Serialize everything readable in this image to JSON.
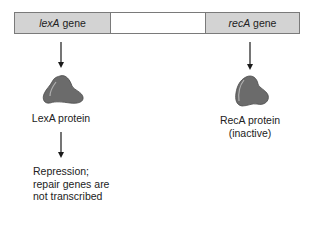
{
  "diagram": {
    "dna": {
      "genes": [
        {
          "name": "lexA",
          "suffix": " gene",
          "fill": "#d3d3d3"
        },
        {
          "name": "",
          "suffix": "",
          "fill": "#ffffff"
        },
        {
          "name": "recA",
          "suffix": " gene",
          "fill": "#d3d3d3"
        }
      ]
    },
    "left_pathway": {
      "protein_label": "LexA protein",
      "outcome_lines": [
        "Repression;",
        "repair genes are",
        "not transcribed"
      ]
    },
    "right_pathway": {
      "protein_label": "RecA protein",
      "protein_state": "(inactive)"
    },
    "colors": {
      "gene_fill": "#d3d3d3",
      "border": "#7a7a7a",
      "protein_fill": "#6b6b6b",
      "protein_highlight": "#a8a8a8",
      "arrow": "#1a1a1a"
    }
  }
}
